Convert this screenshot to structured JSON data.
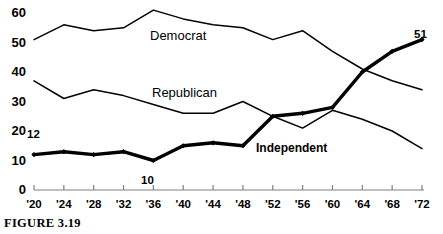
{
  "figure": {
    "caption": "FIGURE 3.19"
  },
  "chart_data": {
    "type": "line",
    "title": "",
    "xlabel": "",
    "ylabel": "",
    "xlim": [
      1920,
      1972
    ],
    "ylim": [
      0,
      60
    ],
    "grid": false,
    "legend_position": "inline-labels",
    "x": [
      1920,
      1924,
      1928,
      1932,
      1936,
      1940,
      1944,
      1948,
      1952,
      1956,
      1960,
      1964,
      1968,
      1972
    ],
    "categories": [
      "'20",
      "'24",
      "'28",
      "'32",
      "'36",
      "'40",
      "'44",
      "'48",
      "'52",
      "'56",
      "'60",
      "'64",
      "'68",
      "'72"
    ],
    "ytick_labels": [
      "0",
      "10",
      "20",
      "30",
      "40",
      "50",
      "60"
    ],
    "ytick_values": [
      0,
      10,
      20,
      30,
      40,
      50,
      60
    ],
    "series": [
      {
        "name": "Democrat",
        "values": [
          51,
          56,
          54,
          55,
          61,
          58,
          56,
          55,
          51,
          54,
          47,
          41,
          37,
          34
        ],
        "style": "thin",
        "markers": false
      },
      {
        "name": "Republican",
        "values": [
          37,
          31,
          34,
          32,
          29,
          26,
          26,
          30,
          25,
          21,
          27,
          24,
          20,
          14
        ],
        "style": "thin",
        "markers": false
      },
      {
        "name": "Independent",
        "values": [
          12,
          13,
          12,
          13,
          10,
          15,
          16,
          15,
          25,
          26,
          28,
          40,
          47,
          51
        ],
        "style": "thick",
        "markers": true
      }
    ],
    "annotations": [
      {
        "text": "12",
        "x": 1920,
        "y": 12,
        "note": "start value of Independent"
      },
      {
        "text": "10",
        "x": 1936,
        "y": 10,
        "note": "minimum of Independent"
      },
      {
        "text": "51",
        "x": 1972,
        "y": 51,
        "note": "end value of Independent"
      }
    ],
    "inline_labels": [
      {
        "text": "Democrat",
        "series": "Democrat"
      },
      {
        "text": "Republican",
        "series": "Republican"
      },
      {
        "text": "Independent",
        "series": "Independent"
      }
    ]
  }
}
